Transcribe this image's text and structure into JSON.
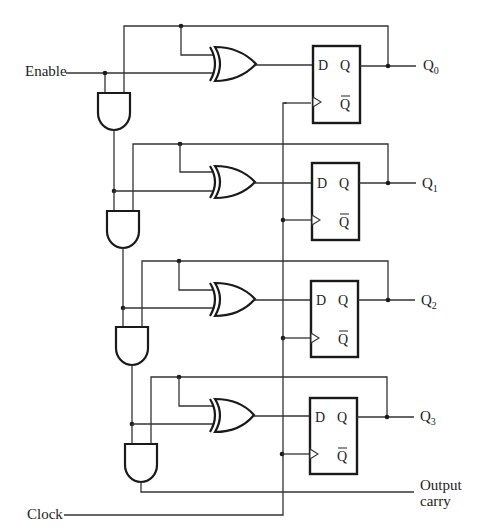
{
  "diagram": {
    "type": "4-bit synchronous counter (T flip-flops built from XOR + D flip-flops)",
    "inputs": {
      "enable_label": "Enable",
      "clock_label": "Clock"
    },
    "outputs": {
      "carry_label_line1": "Output",
      "carry_label_line2": "carry"
    },
    "stages": [
      {
        "output_main": "Q",
        "output_sub": "0",
        "d_pin": "D",
        "q_pin": "Q",
        "qbar_pin": "Q"
      },
      {
        "output_main": "Q",
        "output_sub": "1",
        "d_pin": "D",
        "q_pin": "Q",
        "qbar_pin": "Q"
      },
      {
        "output_main": "Q",
        "output_sub": "2",
        "d_pin": "D",
        "q_pin": "Q",
        "qbar_pin": "Q"
      },
      {
        "output_main": "Q",
        "output_sub": "3",
        "d_pin": "D",
        "q_pin": "Q",
        "qbar_pin": "Q"
      }
    ],
    "components": {
      "xor_gates": 4,
      "and_gates": 4,
      "d_flip_flops": 4
    }
  }
}
